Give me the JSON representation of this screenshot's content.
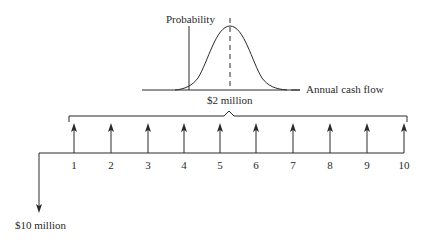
{
  "diagram": {
    "distribution": {
      "y_axis_label": "Probability",
      "x_axis_label": "Annual cash flow",
      "mean_label": "$2 million"
    },
    "timeline": {
      "initial_outflow_label": "$10 million",
      "periods": [
        "1",
        "2",
        "3",
        "4",
        "5",
        "6",
        "7",
        "8",
        "9",
        "10"
      ]
    },
    "colors": {
      "line": "#2a2a2a",
      "background": "#ffffff"
    }
  }
}
